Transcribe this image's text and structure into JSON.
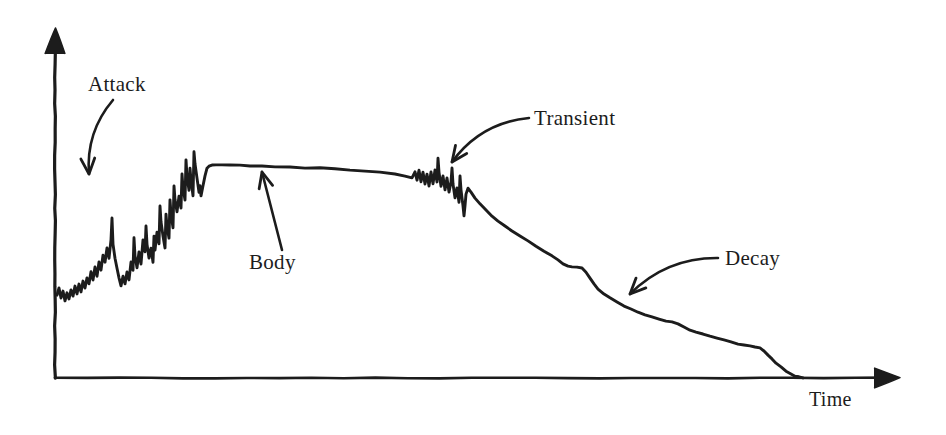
{
  "figure": {
    "kind": "sound-envelope-diagram",
    "background_color": "#ffffff",
    "ink_color": "#1c1c1c",
    "width": 946,
    "height": 435
  },
  "axes": {
    "x_label": "Time",
    "y_label": "",
    "origin": {
      "x": 55,
      "y": 378
    },
    "x_axis_end": {
      "x": 900,
      "y": 378
    },
    "y_axis_top": {
      "x": 55,
      "y": 28
    },
    "x_arrowhead": true,
    "y_arrowhead": true,
    "ticks": [],
    "tick_labels": [],
    "grid": false
  },
  "annotations": [
    {
      "id": "attack",
      "label": "Attack",
      "label_x": 88,
      "label_y": 74,
      "arrow_kind": "curved",
      "arrow_from": {
        "x": 113,
        "y": 100
      },
      "arrow_to": {
        "x": 89,
        "y": 174
      },
      "arrow_direction": "down-left",
      "points_at": "attack-segment"
    },
    {
      "id": "transient",
      "label": "Transient",
      "label_x": 534,
      "label_y": 108,
      "arrow_kind": "curved",
      "arrow_from": {
        "x": 529,
        "y": 118
      },
      "arrow_to": {
        "x": 452,
        "y": 162
      },
      "arrow_direction": "down-left",
      "points_at": "transient-burst"
    },
    {
      "id": "body",
      "label": "Body",
      "label_x": 249,
      "label_y": 252,
      "arrow_kind": "straight",
      "arrow_from": {
        "x": 282,
        "y": 250
      },
      "arrow_to": {
        "x": 262,
        "y": 172
      },
      "arrow_direction": "up-left",
      "points_at": "body-plateau"
    },
    {
      "id": "decay",
      "label": "Decay",
      "label_x": 725,
      "label_y": 248,
      "arrow_kind": "curved",
      "arrow_from": {
        "x": 718,
        "y": 258
      },
      "arrow_to": {
        "x": 630,
        "y": 294
      },
      "arrow_direction": "down-left",
      "points_at": "decay-slope"
    }
  ],
  "chart_data": {
    "type": "line",
    "title": "",
    "subtitle": "",
    "xlabel": "Time",
    "ylabel": "",
    "grid": false,
    "legend": [],
    "xlim": [
      55,
      900
    ],
    "ylim": [
      378,
      28
    ],
    "axis_note": "Unlabeled amplitude axis; values are pixel positions of the hand-drawn envelope curve.",
    "phases": [
      {
        "name": "Attack",
        "x_start": 57,
        "x_end": 170,
        "description": "Rapid noisy rise with jagged peaks from near-silence to full amplitude"
      },
      {
        "name": "Body",
        "x_start": 170,
        "x_end": 415,
        "description": "Sustained near-flat plateau with a very slight downward drift"
      },
      {
        "name": "Transient",
        "x_start": 415,
        "x_end": 468,
        "description": "Short jagged burst of spikes interrupting the sustain"
      },
      {
        "name": "Decay",
        "x_start": 468,
        "x_end": 800,
        "description": "Stepped descent back to the baseline"
      }
    ],
    "series": [
      {
        "name": "Amplitude envelope",
        "color": "#1c1c1c",
        "points": [
          [
            57,
            295
          ],
          [
            59,
            288
          ],
          [
            61,
            298
          ],
          [
            63,
            291
          ],
          [
            65,
            301
          ],
          [
            67,
            293
          ],
          [
            69,
            299
          ],
          [
            71,
            290
          ],
          [
            73,
            296
          ],
          [
            75,
            286
          ],
          [
            77,
            294
          ],
          [
            79,
            284
          ],
          [
            81,
            292
          ],
          [
            83,
            281
          ],
          [
            85,
            288
          ],
          [
            87,
            278
          ],
          [
            89,
            284
          ],
          [
            91,
            272
          ],
          [
            93,
            280
          ],
          [
            95,
            267
          ],
          [
            97,
            276
          ],
          [
            99,
            262
          ],
          [
            101,
            270
          ],
          [
            103,
            255
          ],
          [
            105,
            262
          ],
          [
            107,
            248
          ],
          [
            109,
            258
          ],
          [
            111,
            240
          ],
          [
            112,
            218
          ],
          [
            113,
            244
          ],
          [
            115,
            258
          ],
          [
            117,
            268
          ],
          [
            119,
            278
          ],
          [
            121,
            286
          ],
          [
            123,
            276
          ],
          [
            125,
            284
          ],
          [
            127,
            272
          ],
          [
            129,
            280
          ],
          [
            131,
            262
          ],
          [
            133,
            270
          ],
          [
            134,
            238
          ],
          [
            135,
            256
          ],
          [
            137,
            268
          ],
          [
            139,
            252
          ],
          [
            141,
            264
          ],
          [
            143,
            240
          ],
          [
            145,
            252
          ],
          [
            146,
            226
          ],
          [
            147,
            244
          ],
          [
            149,
            258
          ],
          [
            151,
            248
          ],
          [
            153,
            262
          ],
          [
            154,
            236
          ],
          [
            155,
            250
          ],
          [
            157,
            232
          ],
          [
            159,
            244
          ],
          [
            160,
            206
          ],
          [
            161,
            222
          ],
          [
            163,
            236
          ],
          [
            165,
            248
          ],
          [
            166,
            214
          ],
          [
            167,
            226
          ],
          [
            169,
            238
          ],
          [
            170,
            200
          ],
          [
            171,
            214
          ],
          [
            173,
            228
          ],
          [
            174,
            186
          ],
          [
            175,
            200
          ],
          [
            177,
            212
          ],
          [
            179,
            196
          ],
          [
            181,
            208
          ],
          [
            182,
            174
          ],
          [
            183,
            188
          ],
          [
            185,
            200
          ],
          [
            186,
            160
          ],
          [
            187,
            176
          ],
          [
            189,
            190
          ],
          [
            190,
            168
          ],
          [
            191,
            180
          ],
          [
            193,
            196
          ],
          [
            194,
            152
          ],
          [
            195,
            164
          ],
          [
            197,
            178
          ],
          [
            199,
            192
          ],
          [
            200,
            186
          ],
          [
            201,
            196
          ],
          [
            203,
            186
          ],
          [
            205,
            176
          ],
          [
            207,
            168
          ],
          [
            209,
            166
          ],
          [
            212,
            165
          ],
          [
            216,
            165
          ],
          [
            222,
            165
          ],
          [
            230,
            165
          ],
          [
            240,
            165
          ],
          [
            250,
            166
          ],
          [
            262,
            166
          ],
          [
            275,
            167
          ],
          [
            290,
            167
          ],
          [
            305,
            168
          ],
          [
            320,
            168
          ],
          [
            335,
            169
          ],
          [
            350,
            170
          ],
          [
            365,
            171
          ],
          [
            380,
            172
          ],
          [
            395,
            174
          ],
          [
            405,
            176
          ],
          [
            412,
            178
          ],
          [
            415,
            172
          ],
          [
            417,
            180
          ],
          [
            419,
            170
          ],
          [
            421,
            182
          ],
          [
            423,
            172
          ],
          [
            425,
            184
          ],
          [
            427,
            174
          ],
          [
            429,
            186
          ],
          [
            431,
            172
          ],
          [
            433,
            184
          ],
          [
            435,
            170
          ],
          [
            437,
            182
          ],
          [
            438,
            158
          ],
          [
            439,
            172
          ],
          [
            441,
            186
          ],
          [
            443,
            176
          ],
          [
            445,
            190
          ],
          [
            447,
            178
          ],
          [
            449,
            192
          ],
          [
            451,
            182
          ],
          [
            452,
            168
          ],
          [
            453,
            184
          ],
          [
            455,
            198
          ],
          [
            457,
            188
          ],
          [
            459,
            202
          ],
          [
            460,
            176
          ],
          [
            461,
            190
          ],
          [
            463,
            206
          ],
          [
            464,
            216
          ],
          [
            465,
            206
          ],
          [
            466,
            194
          ],
          [
            468,
            188
          ],
          [
            471,
            192
          ],
          [
            475,
            198
          ],
          [
            480,
            204
          ],
          [
            486,
            210
          ],
          [
            492,
            216
          ],
          [
            498,
            221
          ],
          [
            505,
            226
          ],
          [
            512,
            231
          ],
          [
            520,
            236
          ],
          [
            528,
            241
          ],
          [
            536,
            246
          ],
          [
            544,
            251
          ],
          [
            552,
            256
          ],
          [
            558,
            260
          ],
          [
            563,
            264
          ],
          [
            568,
            266
          ],
          [
            572,
            267
          ],
          [
            577,
            267
          ],
          [
            582,
            268
          ],
          [
            586,
            272
          ],
          [
            590,
            278
          ],
          [
            594,
            284
          ],
          [
            598,
            289
          ],
          [
            604,
            294
          ],
          [
            610,
            298
          ],
          [
            617,
            302
          ],
          [
            624,
            306
          ],
          [
            631,
            309
          ],
          [
            638,
            312
          ],
          [
            645,
            315
          ],
          [
            652,
            317
          ],
          [
            659,
            319
          ],
          [
            666,
            321
          ],
          [
            672,
            322
          ],
          [
            678,
            324
          ],
          [
            684,
            327
          ],
          [
            690,
            330
          ],
          [
            696,
            332
          ],
          [
            703,
            334
          ],
          [
            710,
            336
          ],
          [
            717,
            338
          ],
          [
            724,
            340
          ],
          [
            731,
            342
          ],
          [
            738,
            344
          ],
          [
            744,
            345
          ],
          [
            750,
            346
          ],
          [
            755,
            347
          ],
          [
            760,
            348
          ],
          [
            764,
            351
          ],
          [
            768,
            355
          ],
          [
            772,
            359
          ],
          [
            776,
            363
          ],
          [
            781,
            367
          ],
          [
            786,
            371
          ],
          [
            791,
            374
          ],
          [
            795,
            376
          ],
          [
            799,
            377
          ],
          [
            803,
            378
          ]
        ]
      }
    ]
  }
}
